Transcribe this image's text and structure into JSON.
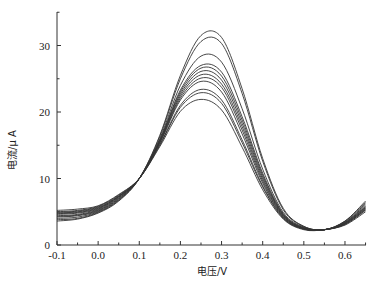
{
  "chart_data": {
    "type": "line",
    "title": "",
    "xlabel": "电压/V",
    "ylabel": "电流/μA",
    "xlim": [
      -0.1,
      0.65
    ],
    "ylim": [
      0,
      35
    ],
    "x_ticks": [
      -0.1,
      0.0,
      0.1,
      0.2,
      0.3,
      0.4,
      0.5,
      0.6
    ],
    "x_tick_labels": [
      "-0.1",
      "0.0",
      "0.1",
      "0.2",
      "0.3",
      "0.4",
      "0.5",
      "0.6"
    ],
    "y_ticks": [
      0,
      10,
      20,
      30
    ],
    "y_tick_labels": [
      "0",
      "10",
      "20",
      "30"
    ],
    "grid": false,
    "legend": null,
    "x": [
      -0.1,
      -0.05,
      0.0,
      0.05,
      0.1,
      0.15,
      0.2,
      0.25,
      0.3,
      0.35,
      0.4,
      0.45,
      0.5,
      0.55,
      0.6,
      0.65
    ],
    "series": [
      {
        "name": "curve-1",
        "peak_x": 0.28,
        "peak_y": 32.0,
        "values": [
          3.6,
          3.9,
          4.8,
          6.6,
          10.0,
          16.5,
          25.5,
          31.5,
          31.2,
          23.5,
          13.0,
          5.5,
          2.8,
          2.3,
          3.6,
          6.6
        ]
      },
      {
        "name": "curve-2",
        "peak_x": 0.28,
        "peak_y": 31.1,
        "values": [
          3.8,
          4.0,
          4.9,
          6.7,
          10.0,
          16.3,
          25.0,
          30.6,
          30.3,
          22.8,
          12.6,
          5.3,
          2.8,
          2.3,
          3.6,
          6.4
        ]
      },
      {
        "name": "curve-3",
        "peak_x": 0.27,
        "peak_y": 28.7,
        "values": [
          4.0,
          4.2,
          5.0,
          6.8,
          10.0,
          16.0,
          24.0,
          28.4,
          27.5,
          20.5,
          11.4,
          4.9,
          2.7,
          2.3,
          3.5,
          6.2
        ]
      },
      {
        "name": "curve-4",
        "peak_x": 0.27,
        "peak_y": 27.2,
        "values": [
          4.2,
          4.4,
          5.1,
          6.9,
          10.0,
          15.8,
          23.3,
          27.0,
          26.0,
          19.3,
          10.8,
          4.7,
          2.6,
          2.3,
          3.4,
          6.0
        ]
      },
      {
        "name": "curve-5",
        "peak_x": 0.26,
        "peak_y": 26.8,
        "values": [
          4.3,
          4.5,
          5.2,
          7.0,
          10.0,
          15.7,
          23.0,
          26.6,
          25.4,
          18.8,
          10.5,
          4.6,
          2.6,
          2.3,
          3.4,
          5.8
        ]
      },
      {
        "name": "curve-6",
        "peak_x": 0.26,
        "peak_y": 26.3,
        "values": [
          4.4,
          4.6,
          5.3,
          7.1,
          10.0,
          15.6,
          22.7,
          26.1,
          24.8,
          18.3,
          10.2,
          4.5,
          2.5,
          2.3,
          3.3,
          5.7
        ]
      },
      {
        "name": "curve-7",
        "peak_x": 0.26,
        "peak_y": 25.8,
        "values": [
          4.6,
          4.8,
          5.4,
          7.2,
          10.0,
          15.5,
          22.4,
          25.6,
          24.2,
          17.8,
          9.9,
          4.4,
          2.5,
          2.3,
          3.3,
          5.6
        ]
      },
      {
        "name": "curve-8",
        "peak_x": 0.26,
        "peak_y": 25.3,
        "values": [
          4.7,
          4.9,
          5.5,
          7.3,
          10.0,
          15.4,
          22.1,
          25.1,
          23.7,
          17.3,
          9.6,
          4.3,
          2.5,
          2.3,
          3.2,
          5.5
        ]
      },
      {
        "name": "curve-9",
        "peak_x": 0.25,
        "peak_y": 24.7,
        "values": [
          4.8,
          5.0,
          5.6,
          7.3,
          10.0,
          15.3,
          21.8,
          24.6,
          23.0,
          16.7,
          9.3,
          4.2,
          2.4,
          2.3,
          3.2,
          5.4
        ]
      },
      {
        "name": "curve-10",
        "peak_x": 0.25,
        "peak_y": 23.5,
        "values": [
          4.9,
          5.1,
          5.7,
          7.4,
          10.0,
          15.1,
          21.0,
          23.4,
          21.8,
          15.8,
          8.9,
          4.1,
          2.4,
          2.3,
          3.1,
          5.3
        ]
      },
      {
        "name": "curve-11",
        "peak_x": 0.25,
        "peak_y": 23.0,
        "values": [
          5.0,
          5.2,
          5.8,
          7.5,
          10.0,
          15.0,
          20.7,
          22.9,
          21.3,
          15.4,
          8.7,
          4.0,
          2.4,
          2.3,
          3.1,
          5.2
        ]
      },
      {
        "name": "curve-12",
        "peak_x": 0.25,
        "peak_y": 22.0,
        "values": [
          5.2,
          5.4,
          5.9,
          7.6,
          10.0,
          14.8,
          20.1,
          21.9,
          20.3,
          14.7,
          8.3,
          3.9,
          2.3,
          2.3,
          3.0,
          5.0
        ]
      }
    ]
  },
  "axes": {
    "x_label": "电压/V",
    "y_label": "电流/μ A"
  }
}
